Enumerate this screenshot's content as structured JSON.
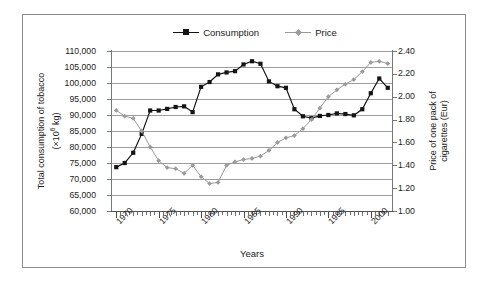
{
  "chart_data": {
    "type": "line",
    "title": "",
    "xlabel": "Years",
    "ylabel": "Total consumption of tobacco (×10⁶ kg)",
    "ylabel_right": "Price of one pack of cigarettes (Eur)",
    "grid": true,
    "legend_position": "top-center",
    "x": [
      1970,
      1971,
      1972,
      1973,
      1974,
      1975,
      1976,
      1977,
      1978,
      1979,
      1980,
      1981,
      1982,
      1983,
      1984,
      1985,
      1986,
      1987,
      1988,
      1989,
      1990,
      1991,
      1992,
      1993,
      1994,
      1995,
      1996,
      1997,
      1998,
      1999,
      2000,
      2001,
      2002
    ],
    "xtick_labels": [
      "1970",
      "1975",
      "1980",
      "1985",
      "1990",
      "1995",
      "2000"
    ],
    "xtick_values": [
      1970,
      1975,
      1980,
      1985,
      1990,
      1995,
      2000
    ],
    "xlim": [
      1969.5,
      2002.5
    ],
    "ylim": [
      60000,
      110000
    ],
    "ytick_labels": [
      "60,000",
      "65,000",
      "70,000",
      "75,000",
      "80,000",
      "85,000",
      "90,000",
      "95,000",
      "100,000",
      "105,000",
      "110,000"
    ],
    "ytick_values": [
      60000,
      65000,
      70000,
      75000,
      80000,
      85000,
      90000,
      95000,
      100000,
      105000,
      110000
    ],
    "ylim_right": [
      1.0,
      2.4
    ],
    "ytick_labels_right": [
      "1.00",
      "1.20",
      "1.40",
      "1.60",
      "1.80",
      "2.00",
      "2.20",
      "2.40"
    ],
    "ytick_values_right": [
      1.0,
      1.2,
      1.4,
      1.6,
      1.8,
      2.0,
      2.2,
      2.4
    ],
    "series": [
      {
        "name": "Consumption",
        "axis": "left",
        "color": "#141414",
        "marker": "square",
        "values": [
          73700,
          75000,
          78200,
          84100,
          91400,
          91400,
          91900,
          92500,
          92700,
          90900,
          98800,
          100300,
          102700,
          103300,
          103700,
          105800,
          106800,
          106000,
          100500,
          99000,
          98500,
          91800,
          89600,
          89000,
          89700,
          90000,
          90500,
          90300,
          89900,
          91800,
          96800,
          101400,
          98500
        ]
      },
      {
        "name": "Price",
        "axis": "right",
        "color": "#9a9a9a",
        "marker": "diamond",
        "values": [
          1.88,
          1.83,
          1.81,
          1.7,
          1.56,
          1.44,
          1.38,
          1.37,
          1.33,
          1.4,
          1.3,
          1.24,
          1.25,
          1.4,
          1.43,
          1.45,
          1.46,
          1.48,
          1.53,
          1.6,
          1.64,
          1.66,
          1.72,
          1.8,
          1.9,
          2.0,
          2.06,
          2.11,
          2.15,
          2.22,
          2.3,
          2.31,
          2.29
        ]
      }
    ]
  },
  "legend": {
    "entries": [
      {
        "label": "Consumption"
      },
      {
        "label": "Price"
      }
    ]
  },
  "axes": {
    "xlabel": "Years",
    "ylabel_left_line1": "Total consumption of tobacco",
    "ylabel_left_line2_pre": "(×10",
    "ylabel_left_line2_sup": "6",
    "ylabel_left_line2_post": " kg)",
    "ylabel_right_line1": "Price of one pack of",
    "ylabel_right_line2": "cigarettes (Eur)"
  },
  "colors": {
    "consumption": "#141414",
    "price": "#9a9a9a",
    "grid": "#9d9d9d",
    "frame": "#8a8a8a",
    "background": "#ffffff"
  }
}
